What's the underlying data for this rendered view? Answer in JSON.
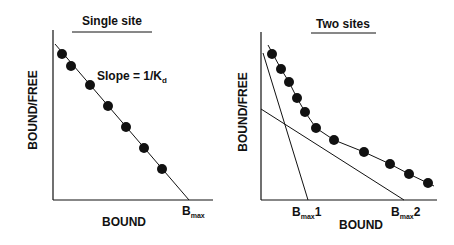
{
  "panels": [
    {
      "title": "Single site",
      "ylabel": "BOUND/FREE",
      "xlabel": "BOUND",
      "annotation": {
        "prefix": "Slope = 1/K",
        "subscript": "d"
      },
      "intercept_label": {
        "main": "B",
        "subscript": "max",
        "suffix": ""
      }
    },
    {
      "title": "Two sites",
      "ylabel": "BOUND/FREE",
      "xlabel": "BOUND",
      "intercept_labels": [
        {
          "main": "B",
          "subscript": "max",
          "suffix": "1"
        },
        {
          "main": "B",
          "subscript": "max",
          "suffix": "2"
        }
      ]
    }
  ],
  "colors": {
    "ink": "#111111",
    "background": "#ffffff"
  }
}
